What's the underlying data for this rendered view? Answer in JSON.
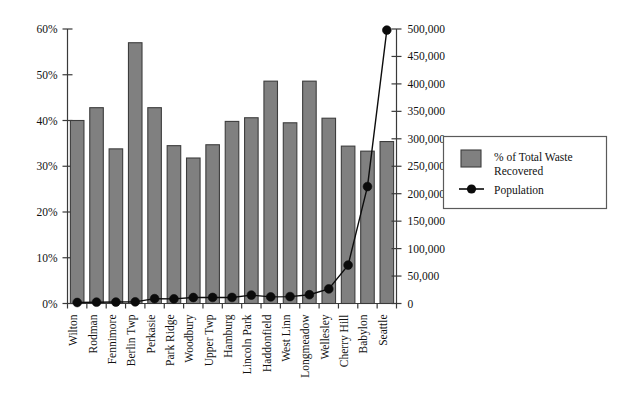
{
  "chart_data": {
    "type": "bar",
    "title": "",
    "subtitle": "",
    "xlabel": "",
    "ylabel": "",
    "grid": false,
    "legend_position": "right",
    "categories": [
      "Wilton",
      "Rodman",
      "Fennimore",
      "Berlin Twp",
      "Perkasie",
      "Park Ridge",
      "Woodbury",
      "Upper Twp",
      "Hamburg",
      "Lincoln Park",
      "Haddonfield",
      "West Linn",
      "Longmeadow",
      "Wellesley",
      "Cherry Hill",
      "Babylon",
      "Seattle"
    ],
    "series": [
      {
        "name": "% of Total Waste Recovered",
        "type": "bar",
        "axis": "left",
        "color": "#808080",
        "edge_color": "#3d3d3d",
        "values": [
          40.0,
          42.8,
          33.8,
          57.0,
          42.8,
          34.5,
          31.8,
          34.7,
          39.8,
          40.6,
          48.6,
          39.5,
          48.6,
          40.5,
          34.4,
          33.3,
          35.4
        ]
      },
      {
        "name": "Population",
        "type": "line",
        "axis": "right",
        "color": "#0b0b0b",
        "marker": "circle",
        "values": [
          1800,
          2400,
          2600,
          3000,
          8800,
          8500,
          10900,
          11000,
          11000,
          15300,
          12000,
          12600,
          16000,
          26600,
          70000,
          213000,
          498000
        ]
      }
    ],
    "left_axis": {
      "label": "",
      "ylim": [
        0,
        60
      ],
      "ticks": [
        0,
        10,
        20,
        30,
        40,
        50,
        60
      ],
      "tick_labels": [
        "0%",
        "10%",
        "20%",
        "30%",
        "40%",
        "50%",
        "60%"
      ]
    },
    "right_axis": {
      "label": "",
      "ylim": [
        0,
        500000
      ],
      "ticks": [
        0,
        50000,
        100000,
        150000,
        200000,
        250000,
        300000,
        350000,
        400000,
        450000,
        500000
      ],
      "tick_labels": [
        "0",
        "50,000",
        "100,000",
        "150,000",
        "200,000",
        "250,000",
        "300,000",
        "350,000",
        "400,000",
        "450,000",
        "500,000"
      ]
    },
    "legend": {
      "entries": [
        {
          "label_line1": "% of Total Waste",
          "label_line2": "Recovered",
          "marker": "swatch-gray"
        },
        {
          "label_line1": "Population",
          "label_line2": "",
          "marker": "line-dot-black"
        }
      ]
    }
  }
}
